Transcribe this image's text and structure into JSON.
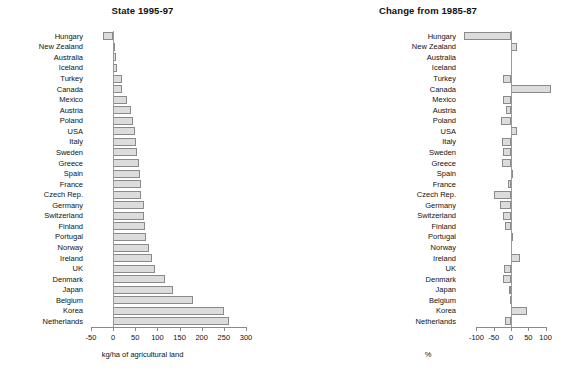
{
  "figure": {
    "categories": [
      "Hungary",
      "New Zealand",
      "Australia",
      "Iceland",
      "Turkey",
      "Canada",
      "Mexico",
      "Austria",
      "Poland",
      "USA",
      "Italy",
      "Sweden",
      "Greece",
      "Spain",
      "France",
      "Czech Rep.",
      "Germany",
      "Switzerland",
      "Finland",
      "Portugal",
      "Norway",
      "Ireland",
      "UK",
      "Denmark",
      "Japan",
      "Belgium",
      "Korea",
      "Netherlands"
    ]
  },
  "chart_data": [
    {
      "type": "bar",
      "orientation": "horizontal",
      "title": "State 1995-97",
      "xlabel": "kg/ha of agricultural land",
      "ylabel": "",
      "xlim": [
        -50,
        300
      ],
      "xticks": [
        -50,
        0,
        50,
        100,
        150,
        200,
        250,
        300
      ],
      "xticklabels": [
        "-50",
        "0",
        "50",
        "100",
        "150",
        "200",
        "250",
        "300"
      ],
      "grid": false,
      "legend": "none",
      "bar_color": "#dcdcdc",
      "bar_edge_color": "#8a8a8a",
      "categories": [
        "Hungary",
        "New Zealand",
        "Australia",
        "Iceland",
        "Turkey",
        "Canada",
        "Mexico",
        "Austria",
        "Poland",
        "USA",
        "Italy",
        "Sweden",
        "Greece",
        "Spain",
        "France",
        "Czech Rep.",
        "Germany",
        "Switzerland",
        "Finland",
        "Portugal",
        "Norway",
        "Ireland",
        "UK",
        "Denmark",
        "Japan",
        "Belgium",
        "Korea",
        "Netherlands"
      ],
      "values": [
        -22,
        4,
        7,
        8,
        20,
        21,
        32,
        41,
        45,
        49,
        51,
        53,
        58,
        60,
        62,
        62,
        70,
        70,
        73,
        75,
        82,
        88,
        95,
        118,
        135,
        180,
        251,
        262
      ]
    },
    {
      "type": "bar",
      "orientation": "horizontal",
      "title": "Change from 1985-87",
      "xlabel": "%",
      "ylabel": "",
      "xlim": [
        -136,
        130
      ],
      "xticks": [
        -100,
        -50,
        0,
        50,
        100
      ],
      "xticklabels": [
        "-100",
        "-50",
        "0",
        "50",
        "100"
      ],
      "grid": false,
      "legend": "none",
      "bar_color": "#dcdcdc",
      "bar_edge_color": "#8a8a8a",
      "categories": [
        "Hungary",
        "New Zealand",
        "Australia",
        "Iceland",
        "Turkey",
        "Canada",
        "Mexico",
        "Austria",
        "Poland",
        "USA",
        "Italy",
        "Sweden",
        "Greece",
        "Spain",
        "France",
        "Czech Rep.",
        "Germany",
        "Switzerland",
        "Finland",
        "Portugal",
        "Norway",
        "Ireland",
        "UK",
        "Denmark",
        "Japan",
        "Belgium",
        "Korea",
        "Netherlands"
      ],
      "values": [
        -136,
        18,
        0,
        0,
        -23,
        116,
        -23,
        -16,
        -28,
        18,
        -25,
        -22,
        -25,
        2,
        -8,
        -48,
        -33,
        -24,
        -18,
        5,
        1,
        27,
        -19,
        -23,
        -6,
        -3,
        45,
        -18
      ]
    }
  ]
}
